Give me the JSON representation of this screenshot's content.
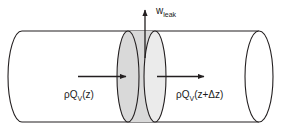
{
  "figure": {
    "background_color": "#ffffff",
    "stroke_color": "#231f20",
    "slab_fill_color": "#d9d9d9",
    "slab_face_fill_color": "#ebebeb",
    "pipe_fill_color": "#ffffff"
  },
  "labels": {
    "leak": {
      "base": "w",
      "subscript": "leak",
      "full": "w_leak",
      "description": "mass leak rate out of the pipe wall"
    },
    "inflow": {
      "rho": "ρ",
      "q": "Q",
      "subscript": "V",
      "argument": "(z)",
      "full": "ρQ_V(z)",
      "description": "mass flow entering control volume at z"
    },
    "outflow": {
      "rho": "ρ",
      "q": "Q",
      "subscript": "V",
      "argument": "(z+Δz)",
      "full": "ρQ_V(z+Δz)",
      "description": "mass flow leaving control volume at z+Δz"
    }
  },
  "arrows": [
    {
      "name": "leak-arrow",
      "direction": "up",
      "label_ref": "leak"
    },
    {
      "name": "inflow-arrow",
      "direction": "right",
      "label_ref": "inflow"
    },
    {
      "name": "outflow-arrow",
      "direction": "right",
      "label_ref": "outflow"
    }
  ],
  "shapes": {
    "pipe": "horizontal cylinder",
    "control_volume": "shaded disc slab between two ellipses"
  }
}
